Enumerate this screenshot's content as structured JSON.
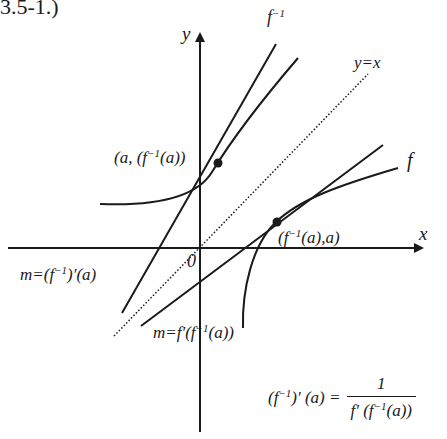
{
  "caption": "3.5-1.)",
  "axes": {
    "x_label": "x",
    "y_label": "y",
    "origin_label": "0"
  },
  "curves": {
    "f_inverse_label": "f",
    "f_inverse_sup": "−1",
    "f_label": "f",
    "identity_label": "y=x"
  },
  "points": {
    "p1_label_pre": "(a, (f",
    "p1_label_sup": "−1",
    "p1_label_post": "(a))",
    "p2_label_pre": "(f",
    "p2_label_sup": "−1",
    "p2_label_post": "(a),a)"
  },
  "slopes": {
    "inverse_slope_pre": "m=(f",
    "inverse_slope_sup": "−1",
    "inverse_slope_post": ")′(a)",
    "f_slope_pre": "m=f′(f",
    "f_slope_sup": "−1",
    "f_slope_post": "(a))"
  },
  "formula": {
    "lhs_pre": "(f",
    "lhs_sup": "−1",
    "lhs_post": ")′ (a) =",
    "numerator": "1",
    "den_pre": "f′ (f",
    "den_sup": "−1",
    "den_post": "(a))"
  },
  "colors": {
    "ink": "#1a1a1a",
    "background": "#ffffff"
  }
}
